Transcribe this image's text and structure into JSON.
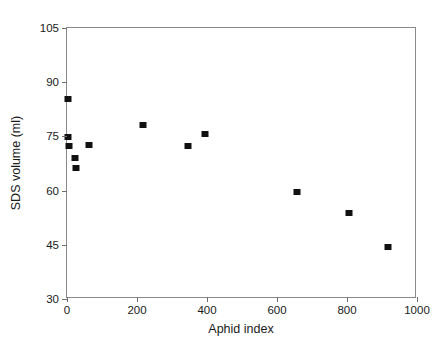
{
  "chart_data": {
    "type": "scatter",
    "title": "",
    "xlabel": "Aphid index",
    "ylabel": "SDS volume (ml)",
    "xlim": [
      0,
      1000
    ],
    "ylim": [
      30,
      105
    ],
    "xticks": [
      0,
      200,
      400,
      600,
      800,
      1000
    ],
    "yticks": [
      30,
      45,
      60,
      75,
      90,
      105
    ],
    "xtick_labels": [
      "0",
      "200",
      "400",
      "600",
      "800",
      "1000"
    ],
    "ytick_labels": [
      "30",
      "45",
      "60",
      "75",
      "90",
      "105"
    ],
    "grid": false,
    "legend": false,
    "marker_color": "#111111",
    "frame_color": "#8a8a8a",
    "points": [
      {
        "x": 2,
        "y": 85.3
      },
      {
        "x": 4,
        "y": 74.8
      },
      {
        "x": 6,
        "y": 72.3
      },
      {
        "x": 24,
        "y": 69.0
      },
      {
        "x": 26,
        "y": 66.3
      },
      {
        "x": 63,
        "y": 72.5
      },
      {
        "x": 218,
        "y": 78.2
      },
      {
        "x": 345,
        "y": 72.3
      },
      {
        "x": 393,
        "y": 75.8
      },
      {
        "x": 657,
        "y": 59.7
      },
      {
        "x": 806,
        "y": 53.9
      },
      {
        "x": 917,
        "y": 44.3
      }
    ]
  }
}
